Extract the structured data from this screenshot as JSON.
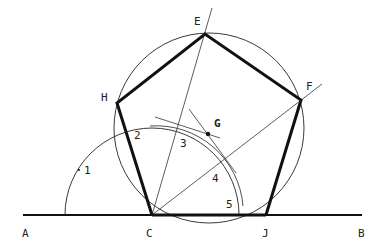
{
  "diagram": {
    "colors": {
      "ink": "#111111",
      "background": "#ffffff"
    },
    "points": {
      "A": {
        "label": "A",
        "x": 22,
        "y": 237
      },
      "B": {
        "label": "B",
        "x": 358,
        "y": 237
      },
      "C": {
        "label": "C",
        "x": 146,
        "y": 237
      },
      "J": {
        "label": "J",
        "x": 262,
        "y": 237
      },
      "E": {
        "label": "E",
        "x": 194,
        "y": 25
      },
      "F": {
        "label": "F",
        "x": 306,
        "y": 90
      },
      "H": {
        "label": "H",
        "x": 101,
        "y": 101
      },
      "G": {
        "label": "G",
        "x": 214,
        "y": 127
      }
    },
    "arc_numbers": [
      {
        "label": "1",
        "x": 84,
        "y": 174
      },
      {
        "label": "2",
        "x": 134,
        "y": 139
      },
      {
        "label": "3",
        "x": 180,
        "y": 147
      },
      {
        "label": "4",
        "x": 212,
        "y": 182
      },
      {
        "label": "5",
        "x": 226,
        "y": 208
      }
    ]
  }
}
